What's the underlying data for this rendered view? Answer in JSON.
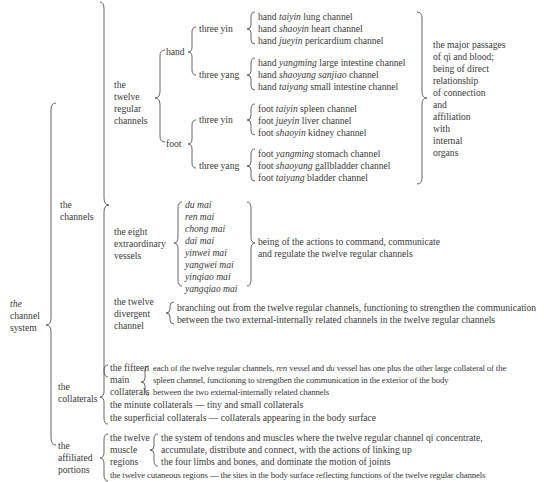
{
  "root": {
    "label_italic": "the",
    "label_rest": [
      "channel",
      "system"
    ]
  },
  "channels": {
    "label": [
      "the",
      "channels"
    ],
    "twelve_regular": {
      "label": [
        "the",
        "twelve",
        "regular",
        "channels"
      ],
      "hand": {
        "label": "hand",
        "three_yin": {
          "label": "three yin",
          "items": [
            {
              "pre": "hand ",
              "it": "taiyin",
              "post": " lung channel"
            },
            {
              "pre": "hand ",
              "it": "shaoyin",
              "post": " heart channel"
            },
            {
              "pre": "hand ",
              "it": "jueyin",
              "post": " pericardium channel"
            }
          ]
        },
        "three_yang": {
          "label": "three yang",
          "items": [
            {
              "pre": "hand ",
              "it": "yangming",
              "post": " large intestine channel"
            },
            {
              "pre": "hand ",
              "it": "shaoyang sanjiao",
              "post": " channel"
            },
            {
              "pre": "hand ",
              "it": "taiyang",
              "post": " small intestine channel"
            }
          ]
        }
      },
      "foot": {
        "label": "foot",
        "three_yin": {
          "label": "three yin",
          "items": [
            {
              "pre": "foot ",
              "it": "taiyin",
              "post": "  spleen channel"
            },
            {
              "pre": "foot ",
              "it": "jueyin",
              "post": " liver channel"
            },
            {
              "pre": "foot ",
              "it": "shaoyin",
              "post": " kidney channel"
            }
          ]
        },
        "three_yang": {
          "label": "three yang",
          "items": [
            {
              "pre": "foot ",
              "it": "yangming",
              "post": " stomach channel"
            },
            {
              "pre": "foot ",
              "it": "shaoyang",
              "post": " gallbladder channel"
            },
            {
              "pre": "foot ",
              "it": "taiyang",
              "post": "  bladder channel"
            }
          ]
        }
      },
      "description": [
        "the major passages",
        "of qi and blood;",
        "being of direct",
        "relationship",
        "of connection",
        "and",
        "affiliation",
        "with",
        "internal",
        "organs"
      ]
    },
    "eight_extraordinary": {
      "label": [
        "the eight",
        "extraordinary",
        "vessels"
      ],
      "items": [
        "du mai",
        "ren mai",
        "chong mai",
        "dai mai",
        "yinwei mai",
        "yangwei mai",
        "yinqiao mai",
        "yangqiao mai"
      ],
      "description": [
        "being of the actions to command, communicate",
        "and regulate the twelve regular channels"
      ]
    },
    "divergent": {
      "label": [
        "the twelve",
        "divergent",
        "channel"
      ],
      "description": [
        "branching out from the twelve regular channels, functioning to strengthen the communication",
        "between the two external-internally related channels in the twelve regular channels"
      ]
    }
  },
  "collaterals": {
    "label": [
      "the",
      "collaterals"
    ],
    "fifteen": {
      "label": [
        "the fifteen",
        "main",
        "collaterals"
      ],
      "line1_a": "each of the twelve regular channels, ",
      "line1_it1": "ren",
      "line1_b": " vessel and ",
      "line1_it2": "du",
      "line1_c": " vessel has one plus the other large collateral of the",
      "line2": "spleen channel, functioning to strengthen the communication in the exterior of the body",
      "line3": "between the two external-internally related channels"
    },
    "minute": "the minute collaterals — tiny and small collaterals",
    "superficial": "the superficial collaterals — collaterals appearing in the body surface"
  },
  "affiliated": {
    "label": [
      "the",
      "affiliated",
      "portions"
    ],
    "muscle": {
      "label": [
        "the twelve",
        "muscle",
        "regions"
      ],
      "description": [
        "the system of tendons and muscles where the twelve regular channel qi concentrate,",
        "accumulate, distribute and connect, with the actions of linking up",
        "the four limbs and bones, and dominate the motion of joints"
      ]
    },
    "cutaneous": "the twelve cutaneous regions — the sites in the body surface reflecting functions of the twelve regular channels"
  }
}
